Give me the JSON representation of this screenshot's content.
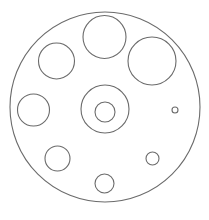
{
  "diagram": {
    "type": "circular-plate-with-holes",
    "background": "#ffffff",
    "stroke_color": "#6b6b6b",
    "stroke_width": 1.1,
    "outer": {
      "name": "outer-plate",
      "cx": 105,
      "cy": 107,
      "r": 95
    },
    "holes": [
      {
        "name": "hole-top-center",
        "cx": 104.5,
        "cy": 37,
        "r": 21.5
      },
      {
        "name": "hole-top-right",
        "cx": 152,
        "cy": 61,
        "r": 24
      },
      {
        "name": "hole-top-left",
        "cx": 56.5,
        "cy": 61,
        "r": 18
      },
      {
        "name": "hole-middle-left",
        "cx": 33.5,
        "cy": 110,
        "r": 16
      },
      {
        "name": "hole-center-outer",
        "cx": 105,
        "cy": 109,
        "r": 24
      },
      {
        "name": "hole-center-inner",
        "cx": 105,
        "cy": 112,
        "r": 10
      },
      {
        "name": "hole-tiny-right",
        "cx": 175,
        "cy": 110,
        "r": 3
      },
      {
        "name": "hole-bottom-left",
        "cx": 57.5,
        "cy": 158.5,
        "r": 12.5
      },
      {
        "name": "hole-bottom-right",
        "cx": 152.5,
        "cy": 158.5,
        "r": 6.5
      },
      {
        "name": "hole-bottom-center",
        "cx": 104.5,
        "cy": 183.5,
        "r": 9.5
      }
    ]
  }
}
